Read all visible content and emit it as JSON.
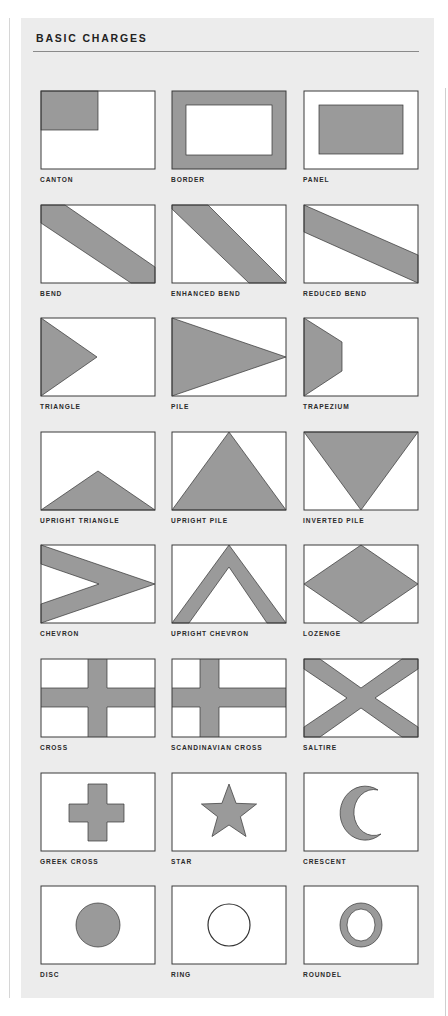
{
  "title": "BASIC CHARGES",
  "colors": {
    "panel": "#ececec",
    "fill": "#9a9a9a",
    "field": "#ffffff",
    "stroke": "#333333"
  },
  "charges": [
    {
      "label": "CANTON",
      "shape": "canton"
    },
    {
      "label": "BORDER",
      "shape": "border"
    },
    {
      "label": "PANEL",
      "shape": "panel"
    },
    {
      "label": "BEND",
      "shape": "bend"
    },
    {
      "label": "ENHANCED BEND",
      "shape": "enhanced-bend"
    },
    {
      "label": "REDUCED BEND",
      "shape": "reduced-bend"
    },
    {
      "label": "TRIANGLE",
      "shape": "triangle"
    },
    {
      "label": "PILE",
      "shape": "pile"
    },
    {
      "label": "TRAPEZIUM",
      "shape": "trapezium"
    },
    {
      "label": "UPRIGHT TRIANGLE",
      "shape": "upright-triangle"
    },
    {
      "label": "UPRIGHT PILE",
      "shape": "upright-pile"
    },
    {
      "label": "INVERTED PILE",
      "shape": "inverted-pile"
    },
    {
      "label": "CHEVRON",
      "shape": "chevron"
    },
    {
      "label": "UPRIGHT CHEVRON",
      "shape": "upright-chevron"
    },
    {
      "label": "LOZENGE",
      "shape": "lozenge"
    },
    {
      "label": "CROSS",
      "shape": "cross"
    },
    {
      "label": "SCANDINAVIAN CROSS",
      "shape": "scandinavian-cross"
    },
    {
      "label": "SALTIRE",
      "shape": "saltire"
    },
    {
      "label": "GREEK CROSS",
      "shape": "greek-cross"
    },
    {
      "label": "STAR",
      "shape": "star"
    },
    {
      "label": "CRESCENT",
      "shape": "crescent"
    },
    {
      "label": "DISC",
      "shape": "disc"
    },
    {
      "label": "RING",
      "shape": "ring"
    },
    {
      "label": "ROUNDEL",
      "shape": "roundel"
    }
  ]
}
